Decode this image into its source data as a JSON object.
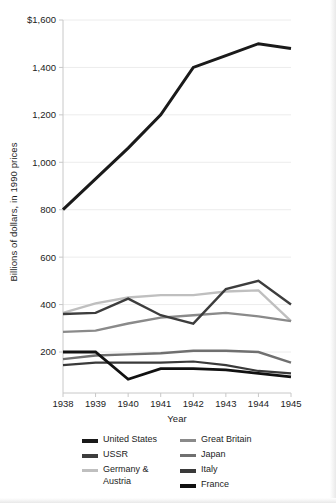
{
  "chart_data": {
    "type": "line",
    "title": "",
    "xlabel": "Year",
    "ylabel": "Billions of dollars, in 1990 prices",
    "x": [
      1938,
      1939,
      1940,
      1941,
      1942,
      1943,
      1944,
      1945
    ],
    "xtick_labels": [
      "1938",
      "1939",
      "1940",
      "1941",
      "1942",
      "1943",
      "1944",
      "1945"
    ],
    "ytick_labels": [
      "200",
      "400",
      "600",
      "800",
      "1,000",
      "1,200",
      "1,400",
      "$1,600"
    ],
    "ytick_values": [
      200,
      400,
      600,
      800,
      1000,
      1200,
      1400,
      1600
    ],
    "ylim": [
      60,
      1600
    ],
    "xlim": [
      1938,
      1945
    ],
    "grid": "horizontal",
    "legend_position": "below",
    "series": [
      {
        "name": "United States",
        "color": "#1a1a1a",
        "width": 3.0,
        "values": [
          800,
          930,
          1060,
          1200,
          1400,
          1450,
          1500,
          1480
        ]
      },
      {
        "name": "USSR",
        "color": "#3d3d3d",
        "width": 2.4,
        "values": [
          360,
          365,
          425,
          355,
          320,
          465,
          500,
          400
        ]
      },
      {
        "name": "Germany & Austria",
        "color": "#bfbfbf",
        "width": 2.4,
        "values": [
          365,
          405,
          430,
          440,
          440,
          455,
          460,
          330
        ]
      },
      {
        "name": "Great Britain",
        "color": "#8a8a8a",
        "width": 2.4,
        "values": [
          285,
          290,
          320,
          345,
          355,
          365,
          350,
          330
        ]
      },
      {
        "name": "Japan",
        "color": "#707070",
        "width": 2.4,
        "values": [
          170,
          185,
          190,
          195,
          205,
          205,
          200,
          155
        ]
      },
      {
        "name": "Italy",
        "color": "#3a3a3a",
        "width": 2.2,
        "values": [
          145,
          155,
          155,
          155,
          160,
          145,
          120,
          110
        ]
      },
      {
        "name": "France",
        "color": "#111111",
        "width": 2.8,
        "values": [
          200,
          200,
          85,
          130,
          130,
          125,
          110,
          95
        ]
      }
    ],
    "legend_entries": [
      {
        "label": "United States",
        "color": "#1a1a1a",
        "thick": true
      },
      {
        "label": "USSR",
        "color": "#3d3d3d",
        "thick": true
      },
      {
        "label": "Germany &\nAustria",
        "color": "#bfbfbf",
        "thick": false
      },
      {
        "label": "Great Britain",
        "color": "#8a8a8a",
        "thick": false
      },
      {
        "label": "Japan",
        "color": "#707070",
        "thick": false
      },
      {
        "label": "Italy",
        "color": "#3a3a3a",
        "thick": true
      },
      {
        "label": "France",
        "color": "#111111",
        "thick": true
      }
    ],
    "axis_color": "#c8c8c8",
    "grid_color": "#ececec",
    "tick_text_color": "#1c1c1c",
    "background": "#ffffff"
  }
}
